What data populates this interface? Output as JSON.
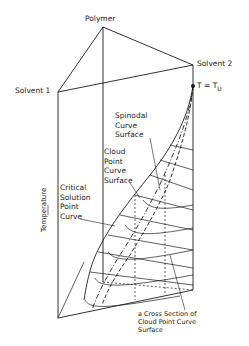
{
  "diagram": {
    "vertices": {
      "polymer": "Polymer",
      "solvent1": "Solvent 1",
      "solvent2": "Solvent 2"
    },
    "temperature_marker": "T = T",
    "temperature_marker_sub": "U",
    "axis_label": "Temperature",
    "annotations": {
      "spinodal": [
        "Spinodal",
        "Curve",
        "Surface"
      ],
      "cloud_point": [
        "Cloud",
        "Point",
        "Curve",
        "Surface"
      ],
      "critical": [
        "Critical",
        "Solution",
        "Point",
        "Curve"
      ],
      "cross_section": [
        "a Cross Section of",
        "Cloud Point Curve",
        "Surface"
      ]
    },
    "colors": {
      "line": "#1a1a1a",
      "background": "#ffffff"
    }
  }
}
